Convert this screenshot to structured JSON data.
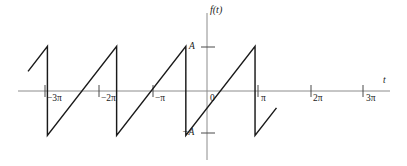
{
  "chart_data": {
    "type": "line",
    "title": "",
    "subtitle": "",
    "xlabel": "t",
    "ylabel": "f(t)",
    "grid": false,
    "legend": null,
    "xlim": [
      -3.85,
      6.9
    ],
    "ylim": [
      -1.55,
      1.75
    ],
    "amplitude_label": "A",
    "negative_amplitude_label": "-A",
    "period": "2π",
    "x_ticks": [
      {
        "value": -3,
        "label": "−3π"
      },
      {
        "value": -2,
        "label": "−2π"
      },
      {
        "value": -1,
        "label": "−π"
      },
      {
        "value": 0,
        "label": "0"
      },
      {
        "value": 1,
        "label": "π"
      },
      {
        "value": 2,
        "label": "2π"
      },
      {
        "value": 3,
        "label": "3π"
      }
    ],
    "y_ticks": [
      {
        "value": 1,
        "label": "A"
      },
      {
        "value": -1,
        "label": "−A"
      }
    ],
    "series": [
      {
        "name": "f(t)",
        "points": [
          [
            -3.56,
            0.44
          ],
          [
            -3.0,
            1.0
          ],
          [
            -3.0,
            -1.0
          ],
          [
            -1.0,
            1.0
          ],
          [
            -1.0,
            -1.0
          ],
          [
            1.0,
            1.0
          ],
          [
            1.0,
            -1.0
          ],
          [
            3.0,
            1.0
          ],
          [
            3.0,
            -1.0
          ],
          [
            3.62,
            -0.38
          ]
        ]
      }
    ]
  },
  "labels": {
    "y_axis": "f(t)",
    "x_axis": "t",
    "amplitude_pos": "A",
    "amplitude_neg": "−A",
    "tick_m3pi": "−3π",
    "tick_m2pi": "−2π",
    "tick_mpi": "−π",
    "tick_zero": "0",
    "tick_pi": "π",
    "tick_2pi": "2π",
    "tick_3pi": "3π"
  },
  "colors": {
    "wave": "#1a1a1a",
    "axis": "#8c8c8c",
    "tick": "#4a4a4a",
    "background": "#ffffff",
    "text": "#1a1a1a"
  }
}
